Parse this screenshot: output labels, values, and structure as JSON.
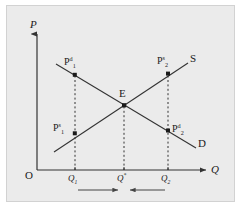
{
  "figure": {
    "type": "supply-demand-convergence-diagram",
    "background_color": "#ebebeb",
    "page_color": "#ffffff",
    "line_color": "#333333",
    "border_color": "#d2d2d2"
  },
  "axes": {
    "y_label": "P",
    "x_label": "Q",
    "origin_label": "O"
  },
  "curves": [
    {
      "name": "supply",
      "label": "S",
      "direction": "upward-sloping"
    },
    {
      "name": "demand",
      "label": "D",
      "direction": "downward-sloping"
    }
  ],
  "points": [
    {
      "name": "equilibrium",
      "label": "E"
    },
    {
      "name": "demand-price-1",
      "base": "P",
      "superscript": "d",
      "subscript": "1"
    },
    {
      "name": "supply-price-1",
      "base": "P",
      "superscript": "s",
      "subscript": "1"
    },
    {
      "name": "supply-price-2",
      "base": "P",
      "superscript": "s",
      "subscript": "2"
    },
    {
      "name": "demand-price-2",
      "base": "P",
      "superscript": "d",
      "subscript": "2"
    }
  ],
  "x_ticks": [
    {
      "name": "q1",
      "base": "Q",
      "subscript": "1"
    },
    {
      "name": "q-star",
      "base": "Q",
      "superscript": "*"
    },
    {
      "name": "q2",
      "base": "Q",
      "subscript": "2"
    }
  ],
  "annotations": {
    "left_arrow_direction": "right",
    "right_arrow_direction": "left",
    "meaning": "convergence toward equilibrium quantity"
  }
}
